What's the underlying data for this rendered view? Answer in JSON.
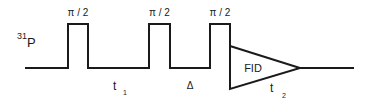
{
  "diagram": {
    "type": "NMR pulse sequence",
    "channel_label": {
      "base": "P",
      "superscript": "31"
    },
    "pulses": [
      {
        "label": "π / 2"
      },
      {
        "label": "π / 2"
      },
      {
        "label": "π / 2"
      }
    ],
    "delays": [
      {
        "label": "t",
        "subscript": "1"
      },
      {
        "label": "Δ"
      }
    ],
    "acquisition": {
      "label": "FID",
      "time_label": "t",
      "time_subscript": "2"
    },
    "colors": {
      "line": "#1a1a1a",
      "background": "#ffffff"
    }
  }
}
